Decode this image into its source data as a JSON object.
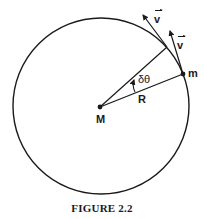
{
  "figure": {
    "caption": "FIGURE 2.2",
    "labels": {
      "central_mass": "M",
      "orbiting_mass": "m",
      "radius": "R",
      "angle": "δθ",
      "velocity_1": "v",
      "velocity_2": "v"
    },
    "geometry": {
      "circle_center": [
        101,
        106
      ],
      "circle_radius": 88,
      "M_position": [
        100,
        107
      ],
      "m_position": [
        183,
        74
      ],
      "radius2_end": [
        167,
        47
      ],
      "velocity1_tip": [
        143,
        15
      ],
      "velocity2_tip": [
        170,
        31
      ]
    },
    "colors": {
      "stroke": "#1a1a1a",
      "background": "#ffffff"
    }
  }
}
